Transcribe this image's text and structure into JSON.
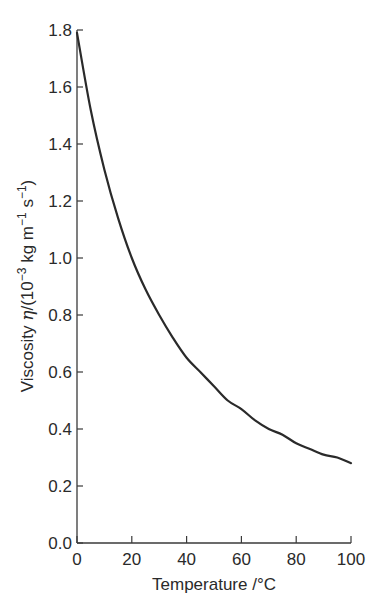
{
  "chart_data": {
    "type": "line",
    "title": "",
    "xlabel": "Temperature /°C",
    "ylabel": "Viscosity η/(10⁻³ kg m⁻¹ s⁻¹)",
    "ylabel_parts": {
      "prefix": "Viscosity ",
      "symbol": "η",
      "open": "/(10",
      "exp1": "−3",
      "mid": " kg m",
      "exp2": "−1",
      "mid2": " s",
      "exp3": "−1",
      "close": ")"
    },
    "xlim": [
      0,
      100
    ],
    "ylim": [
      0.0,
      1.8
    ],
    "xticks": [
      "0",
      "20",
      "40",
      "60",
      "80",
      "100"
    ],
    "yticks": [
      "0.0",
      "0.2",
      "0.4",
      "0.6",
      "0.8",
      "1.0",
      "1.2",
      "1.4",
      "1.6",
      "1.8"
    ],
    "grid": false,
    "legend": null,
    "series": [
      {
        "name": "Viscosity of water",
        "color": "#2a2a2a",
        "x": [
          0,
          5,
          10,
          15,
          20,
          25,
          30,
          35,
          40,
          45,
          50,
          55,
          60,
          65,
          70,
          75,
          80,
          85,
          90,
          95,
          100
        ],
        "y": [
          1.79,
          1.52,
          1.31,
          1.14,
          1.0,
          0.89,
          0.8,
          0.72,
          0.65,
          0.6,
          0.55,
          0.5,
          0.47,
          0.43,
          0.4,
          0.38,
          0.35,
          0.33,
          0.31,
          0.3,
          0.28
        ]
      }
    ]
  }
}
